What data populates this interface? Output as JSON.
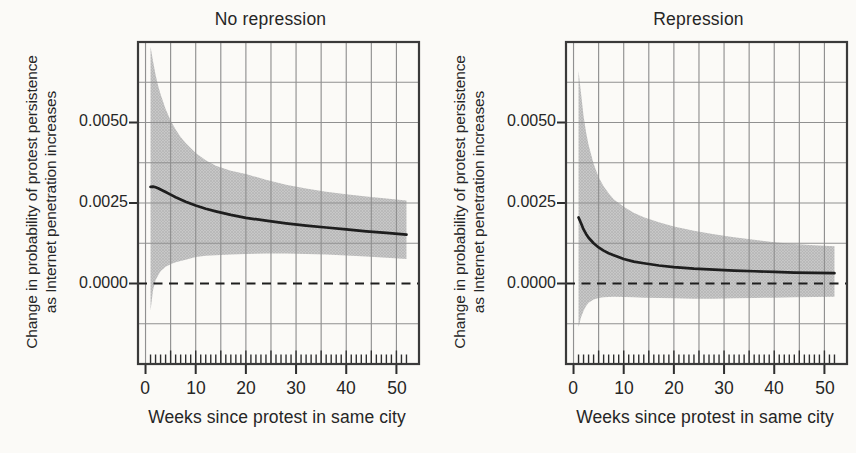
{
  "page": {
    "background": "#fbfaf7",
    "text_color": "#262626"
  },
  "chart_data": [
    {
      "type": "line",
      "title": "No repression",
      "xlabel": "Weeks since protest in same city",
      "ylabel": "Change in probability of protest persistence as Internet penetration increases",
      "ylabel_line1": "Change in probability of protest persistence",
      "ylabel_line2": "as Internet penetration increases",
      "xlim": [
        -1.5,
        54.5
      ],
      "ylim": [
        -0.0025,
        0.0075
      ],
      "xticks": [
        0,
        10,
        20,
        30,
        40,
        50
      ],
      "xtick_labels": [
        "0",
        "10",
        "20",
        "30",
        "40",
        "50"
      ],
      "yticks": [
        0.005,
        0.0025,
        0
      ],
      "ytick_labels": [
        "0.0050",
        "0.0025",
        "0.0000"
      ],
      "x_minor_grid_step": 5,
      "y_grid_values": [
        -0.00125,
        0.00125,
        0.0025,
        0.00375,
        0.005,
        0.00625
      ],
      "zero_reference_line": 0,
      "grid": "on",
      "legend": "none",
      "rug": {
        "from": 1,
        "to": 52
      },
      "series": {
        "x": [
          1,
          1.5,
          2,
          2.5,
          3,
          4,
          5,
          6,
          7,
          8,
          10,
          12,
          14,
          17,
          20,
          24,
          28,
          32,
          36,
          40,
          44,
          48,
          52
        ],
        "estimate": [
          0.003,
          0.00301,
          0.00299,
          0.00296,
          0.00292,
          0.00284,
          0.00276,
          0.00268,
          0.00261,
          0.00254,
          0.00242,
          0.00232,
          0.00224,
          0.00213,
          0.00204,
          0.00195,
          0.00187,
          0.0018,
          0.00174,
          0.00168,
          0.00162,
          0.00157,
          0.00152
        ],
        "ci_upper": [
          0.00735,
          0.0069,
          0.00648,
          0.00615,
          0.00588,
          0.00542,
          0.00506,
          0.00478,
          0.00455,
          0.00436,
          0.00405,
          0.00383,
          0.00366,
          0.0035,
          0.0034,
          0.00322,
          0.00307,
          0.00295,
          0.00285,
          0.00277,
          0.0027,
          0.00264,
          0.00258
        ],
        "ci_lower": [
          -0.00085,
          -0.0002,
          0.0001,
          0.00025,
          0.00038,
          0.00052,
          0.0006,
          0.00066,
          0.0007,
          0.00074,
          0.00082,
          0.00086,
          0.00088,
          0.0009,
          0.00092,
          0.00093,
          0.00093,
          0.00092,
          0.0009,
          0.00087,
          0.00084,
          0.0008,
          0.00076
        ]
      },
      "colors": {
        "band": "#c8c8c8",
        "band_dot": "#a9a9a9",
        "line": "#1e1e1e",
        "grid": "#909090",
        "frame": "#3a3a3a",
        "tick": "#2e2e2e"
      }
    },
    {
      "type": "line",
      "title": "Repression",
      "xlabel": "Weeks since protest in same city",
      "ylabel": "Change in probability of protest persistence as Internet penetration increases",
      "ylabel_line1": "Change in probability of protest persistence",
      "ylabel_line2": "as Internet penetration increases",
      "xlim": [
        -1.5,
        54.5
      ],
      "ylim": [
        -0.0025,
        0.0075
      ],
      "xticks": [
        0,
        10,
        20,
        30,
        40,
        50
      ],
      "xtick_labels": [
        "0",
        "10",
        "20",
        "30",
        "40",
        "50"
      ],
      "yticks": [
        0.005,
        0.0025,
        0
      ],
      "ytick_labels": [
        "0.0050",
        "0.0025",
        "0.0000"
      ],
      "x_minor_grid_step": 5,
      "y_grid_values": [
        -0.00125,
        0.00125,
        0.0025,
        0.00375,
        0.005,
        0.00625
      ],
      "zero_reference_line": 0,
      "grid": "on",
      "legend": "none",
      "rug": {
        "from": 1,
        "to": 52
      },
      "series": {
        "x": [
          1,
          1.5,
          2,
          2.5,
          3,
          4,
          5,
          6,
          7,
          8,
          10,
          12,
          14,
          17,
          20,
          24,
          28,
          32,
          36,
          40,
          44,
          48,
          52
        ],
        "estimate": [
          0.00205,
          0.00187,
          0.00168,
          0.00154,
          0.00142,
          0.00125,
          0.00112,
          0.00102,
          0.00094,
          0.00088,
          0.00076,
          0.00068,
          0.00063,
          0.00056,
          0.00051,
          0.00046,
          0.00043,
          0.0004,
          0.00038,
          0.00036,
          0.00034,
          0.00033,
          0.00032
        ],
        "ci_upper": [
          0.0066,
          0.0059,
          0.0052,
          0.0047,
          0.0043,
          0.00372,
          0.0033,
          0.00302,
          0.0028,
          0.00262,
          0.00238,
          0.0022,
          0.00206,
          0.0019,
          0.00177,
          0.00164,
          0.00153,
          0.00144,
          0.00136,
          0.00128,
          0.00123,
          0.00119,
          0.00116
        ],
        "ci_lower": [
          -0.00135,
          -0.00105,
          -0.00085,
          -0.0007,
          -0.0006,
          -0.0005,
          -0.00045,
          -0.00043,
          -0.00042,
          -0.00041,
          -0.00042,
          -0.00043,
          -0.00044,
          -0.00045,
          -0.00046,
          -0.00047,
          -0.00047,
          -0.00046,
          -0.00045,
          -0.00044,
          -0.00043,
          -0.00042,
          -0.00041
        ]
      },
      "colors": {
        "band": "#c8c8c8",
        "band_dot": "#a9a9a9",
        "line": "#1e1e1e",
        "grid": "#909090",
        "frame": "#3a3a3a",
        "tick": "#2e2e2e"
      }
    }
  ]
}
